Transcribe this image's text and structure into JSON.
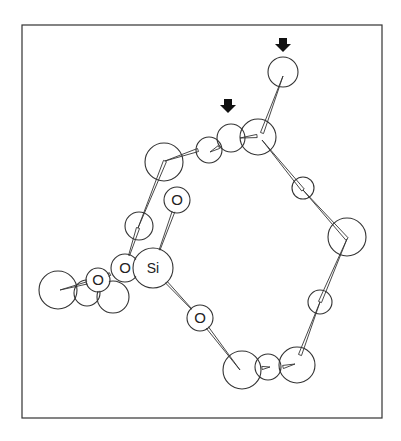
{
  "diagram": {
    "type": "molecular-ball-and-stick",
    "frame": {
      "x": 22,
      "y": 25,
      "w": 360,
      "h": 393
    },
    "colors": {
      "stroke": "#333333",
      "fill": "#ffffff",
      "arrow": "#111111"
    },
    "atoms": [
      {
        "id": "a1",
        "label": "",
        "x": 283,
        "y": 72,
        "r": 15
      },
      {
        "id": "a2",
        "label": "",
        "x": 258,
        "y": 137,
        "r": 18
      },
      {
        "id": "a3",
        "label": "",
        "x": 231,
        "y": 138,
        "r": 14
      },
      {
        "id": "a4",
        "label": "",
        "x": 209,
        "y": 150,
        "r": 13
      },
      {
        "id": "a5",
        "label": "",
        "x": 164,
        "y": 162,
        "r": 19
      },
      {
        "id": "a6",
        "label": "O",
        "x": 177,
        "y": 200,
        "r": 13
      },
      {
        "id": "a7",
        "label": "",
        "x": 139,
        "y": 226,
        "r": 14
      },
      {
        "id": "a8",
        "label": "",
        "x": 113,
        "y": 297,
        "r": 16
      },
      {
        "id": "a9",
        "label": "",
        "x": 87,
        "y": 293,
        "r": 13
      },
      {
        "id": "a10",
        "label": "",
        "x": 58,
        "y": 290,
        "r": 19
      },
      {
        "id": "a11",
        "label": "O",
        "x": 98,
        "y": 280,
        "r": 12
      },
      {
        "id": "a12",
        "label": "O",
        "x": 125,
        "y": 268,
        "r": 14
      },
      {
        "id": "a13",
        "label": "Si",
        "x": 153,
        "y": 268,
        "r": 20
      },
      {
        "id": "a14",
        "label": "O",
        "x": 200,
        "y": 318,
        "r": 13
      },
      {
        "id": "a15",
        "label": "",
        "x": 242,
        "y": 370,
        "r": 19
      },
      {
        "id": "a16",
        "label": "",
        "x": 268,
        "y": 367,
        "r": 13
      },
      {
        "id": "a17",
        "label": "",
        "x": 297,
        "y": 365,
        "r": 18
      },
      {
        "id": "a18",
        "label": "",
        "x": 320,
        "y": 302,
        "r": 12
      },
      {
        "id": "a19",
        "label": "",
        "x": 347,
        "y": 237,
        "r": 19
      },
      {
        "id": "a20",
        "label": "",
        "x": 303,
        "y": 188,
        "r": 11
      }
    ],
    "bonds": [
      {
        "x1": 262,
        "y1": 133,
        "x2": 283,
        "y2": 76
      },
      {
        "x1": 257,
        "y1": 136,
        "x2": 240,
        "y2": 138
      },
      {
        "x1": 219,
        "y1": 147,
        "x2": 210,
        "y2": 152
      },
      {
        "x1": 198,
        "y1": 150,
        "x2": 165,
        "y2": 161
      },
      {
        "x1": 165,
        "y1": 161,
        "x2": 138,
        "y2": 228
      },
      {
        "x1": 138,
        "y1": 228,
        "x2": 125,
        "y2": 268
      },
      {
        "x1": 177,
        "y1": 202,
        "x2": 153,
        "y2": 268
      },
      {
        "x1": 136,
        "y1": 268,
        "x2": 146,
        "y2": 268
      },
      {
        "x1": 98,
        "y1": 280,
        "x2": 60,
        "y2": 290
      },
      {
        "x1": 110,
        "y1": 274,
        "x2": 98,
        "y2": 280
      },
      {
        "x1": 153,
        "y1": 268,
        "x2": 200,
        "y2": 318
      },
      {
        "x1": 200,
        "y1": 318,
        "x2": 240,
        "y2": 370
      },
      {
        "x1": 262,
        "y1": 368,
        "x2": 270,
        "y2": 367
      },
      {
        "x1": 283,
        "y1": 367,
        "x2": 295,
        "y2": 364
      },
      {
        "x1": 300,
        "y1": 355,
        "x2": 320,
        "y2": 302
      },
      {
        "x1": 320,
        "y1": 302,
        "x2": 347,
        "y2": 239
      },
      {
        "x1": 347,
        "y1": 239,
        "x2": 303,
        "y2": 190
      },
      {
        "x1": 303,
        "y1": 190,
        "x2": 262,
        "y2": 140
      }
    ],
    "arrows": [
      {
        "id": "arrow-top",
        "x": 283,
        "y": 46
      },
      {
        "id": "arrow-middle",
        "x": 228,
        "y": 107
      }
    ]
  }
}
